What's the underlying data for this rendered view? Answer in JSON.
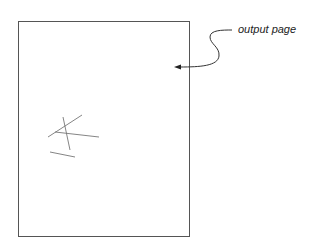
{
  "diagram": {
    "label": "output page",
    "colors": {
      "stroke": "#555555",
      "text": "#222222",
      "background": "#ffffff"
    }
  }
}
